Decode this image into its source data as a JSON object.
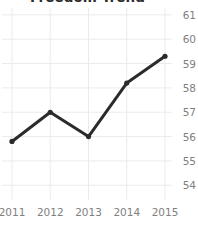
{
  "chart_data": {
    "type": "line",
    "title": "Freedom Trend",
    "xlabel": "",
    "ylabel": "",
    "categories": [
      "2011",
      "2012",
      "2013",
      "2014",
      "2015"
    ],
    "values": [
      55.8,
      57.0,
      56.0,
      58.2,
      59.3
    ],
    "series": [
      {
        "name": "Freedom Trend",
        "values": [
          55.8,
          57.0,
          56.0,
          58.2,
          59.3
        ]
      }
    ],
    "x_tick_labels": [
      "2011",
      "2012",
      "2013",
      "2014",
      "2015"
    ],
    "y_tick_labels": [
      "61",
      "60",
      "59",
      "58",
      "57",
      "56",
      "55",
      "54"
    ],
    "y_ticks": [
      61,
      60,
      59,
      58,
      57,
      56,
      55,
      54
    ],
    "ylim": [
      53.6,
      61.2
    ],
    "grid": "both",
    "y_axis_position": "right",
    "legend": "none",
    "line_color": "#2b2b2b",
    "marker": "circle",
    "marker_color": "#2b2b2b",
    "grid_color": "#ebebeb",
    "tick_label_color": "#808080",
    "background_color": "#ffffff"
  }
}
